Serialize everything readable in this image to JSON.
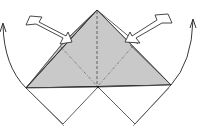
{
  "diagram": {
    "type": "origami-fold-step",
    "colors": {
      "paper_shaded": "#c8c8c8",
      "paper_back": "#d8d8d8",
      "paper_white": "#ffffff",
      "line": "#333333",
      "dash_line": "#555555"
    },
    "arrows": [
      {
        "name": "push-arrow-left",
        "kind": "push",
        "direction": "down-right"
      },
      {
        "name": "push-arrow-right",
        "kind": "push",
        "direction": "down-left"
      },
      {
        "name": "fold-arrow-left",
        "kind": "curved-fold",
        "direction": "up"
      },
      {
        "name": "fold-arrow-right",
        "kind": "curved-fold",
        "direction": "up"
      }
    ],
    "fold_lines": [
      {
        "name": "valley-fold-center",
        "style": "dashed"
      },
      {
        "name": "mountain-fold-left",
        "style": "dash-dot"
      },
      {
        "name": "mountain-fold-right",
        "style": "dash-dot"
      }
    ]
  }
}
